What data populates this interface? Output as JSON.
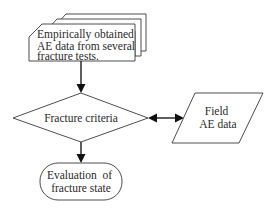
{
  "diagram": {
    "type": "flowchart",
    "nodes": {
      "input_data": {
        "shape": "stacked-documents",
        "lines": [
          "Empirically obtained",
          "AE data from several",
          "fracture tests."
        ]
      },
      "criteria": {
        "shape": "decision-diamond",
        "lines": [
          "Fracture criteria"
        ]
      },
      "field_data": {
        "shape": "parallelogram",
        "lines": [
          "Field",
          "AE data"
        ]
      },
      "evaluation": {
        "shape": "terminal",
        "lines": [
          "Evaluation  of",
          "fracture state"
        ]
      }
    },
    "edges": [
      {
        "from": "input_data",
        "to": "criteria",
        "type": "directed"
      },
      {
        "from": "criteria",
        "to": "field_data",
        "type": "bidirectional"
      },
      {
        "from": "criteria",
        "to": "evaluation",
        "type": "directed"
      }
    ],
    "colors": {
      "stroke": "#3a3a3a",
      "arrow": "#111111",
      "text": "#2a2a2a",
      "background": "#ffffff"
    }
  }
}
